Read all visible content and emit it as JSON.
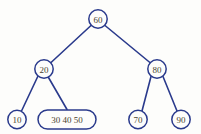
{
  "diagram": {
    "type": "b-tree",
    "title": "",
    "colors": {
      "stroke": "#2a3a8c",
      "text": "#4a4430",
      "background": "#fdfdfb",
      "node_fill": "#fdfdfb"
    },
    "nodes": [
      {
        "id": "root",
        "label": "60",
        "keys": [
          "60"
        ],
        "shape": "circle",
        "cx": 98,
        "cy": 19,
        "r": 9.5,
        "level": 0
      },
      {
        "id": "left-internal",
        "label": "20",
        "keys": [
          "20"
        ],
        "shape": "circle",
        "cx": 44,
        "cy": 69,
        "r": 9.5,
        "level": 1
      },
      {
        "id": "right-internal",
        "label": "80",
        "keys": [
          "80"
        ],
        "shape": "circle",
        "cx": 157,
        "cy": 69,
        "r": 9.5,
        "level": 1
      },
      {
        "id": "leaf-10",
        "label": "10",
        "keys": [
          "10"
        ],
        "shape": "circle",
        "cx": 17,
        "cy": 119.5,
        "r": 9.5,
        "level": 2
      },
      {
        "id": "leaf-30-40-50",
        "label": "30  40  50",
        "keys": [
          "30",
          "40",
          "50"
        ],
        "shape": "stadium",
        "x": 38,
        "y": 110,
        "width": 58,
        "height": 19,
        "level": 2
      },
      {
        "id": "leaf-70",
        "label": "70",
        "keys": [
          "70"
        ],
        "shape": "circle",
        "cx": 138,
        "cy": 119.5,
        "r": 9.5,
        "level": 2
      },
      {
        "id": "leaf-90",
        "label": "90",
        "keys": [
          "90"
        ],
        "shape": "circle",
        "cx": 181,
        "cy": 119.5,
        "r": 9.5,
        "level": 2
      }
    ],
    "edges": [
      {
        "id": "edge-root-left",
        "from": "root",
        "to": "left-internal",
        "x1": 91,
        "y1": 25,
        "x2": 50,
        "y2": 63
      },
      {
        "id": "edge-root-right",
        "from": "root",
        "to": "right-internal",
        "x1": 105,
        "y1": 25,
        "x2": 151,
        "y2": 63
      },
      {
        "id": "edge-left-10",
        "from": "left-internal",
        "to": "leaf-10",
        "x1": 38,
        "y1": 76,
        "x2": 21,
        "y2": 111
      },
      {
        "id": "edge-left-mid",
        "from": "left-internal",
        "to": "leaf-30-40-50",
        "x1": 49,
        "y1": 77,
        "x2": 67,
        "y2": 109
      },
      {
        "id": "edge-right-70",
        "from": "right-internal",
        "to": "leaf-70",
        "x1": 151,
        "y1": 76,
        "x2": 142,
        "y2": 111
      },
      {
        "id": "edge-right-90",
        "from": "right-internal",
        "to": "leaf-90",
        "x1": 163,
        "y1": 76,
        "x2": 177,
        "y2": 111
      }
    ]
  }
}
